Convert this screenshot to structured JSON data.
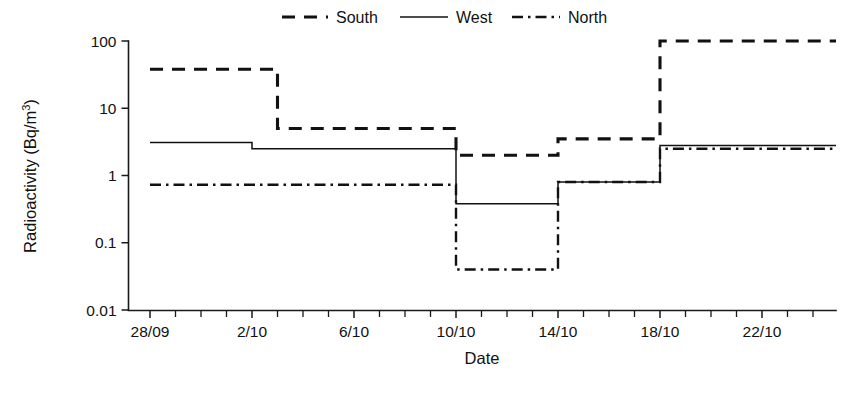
{
  "chart_data": {
    "type": "line",
    "subtype": "step-post",
    "title": "",
    "xlabel": "Date",
    "ylabel": "Radioactivity (Bq/m3)",
    "ylabel_display": "Radioactivity (Bq/m",
    "ylabel_exponent": "3",
    "ylabel_suffix": ")",
    "yscale": "log",
    "ylim": [
      0.01,
      100
    ],
    "ytick_labels": [
      "100",
      "10",
      "1",
      "0.1",
      "0.01"
    ],
    "ytick_values": [
      100,
      10,
      1,
      0.1,
      0.01
    ],
    "xtick_labels": [
      "28/09",
      "2/10",
      "6/10",
      "10/10",
      "14/10",
      "18/10",
      "22/10"
    ],
    "xtick_days": [
      0,
      4,
      8,
      12,
      16,
      20,
      24
    ],
    "x_minor_tick_interval_days": 1,
    "x_range_days": [
      0,
      27
    ],
    "grid": false,
    "legend_position": "top-center",
    "line_color": "#111111",
    "series": [
      {
        "name": "South",
        "style": "dashed",
        "steps": [
          {
            "x_start_day": 0,
            "x_end_day": 5,
            "value": 38
          },
          {
            "x_start_day": 5,
            "x_end_day": 12,
            "value": 5
          },
          {
            "x_start_day": 12,
            "x_end_day": 16,
            "value": 2
          },
          {
            "x_start_day": 16,
            "x_end_day": 20,
            "value": 3.5
          },
          {
            "x_start_day": 20,
            "x_end_day": 27,
            "value": 100
          }
        ]
      },
      {
        "name": "West",
        "style": "solid",
        "steps": [
          {
            "x_start_day": 0,
            "x_end_day": 4,
            "value": 3.1
          },
          {
            "x_start_day": 4,
            "x_end_day": 12,
            "value": 2.5
          },
          {
            "x_start_day": 12,
            "x_end_day": 16,
            "value": 0.38
          },
          {
            "x_start_day": 16,
            "x_end_day": 20,
            "value": 0.8
          },
          {
            "x_start_day": 20,
            "x_end_day": 27,
            "value": 2.8
          }
        ]
      },
      {
        "name": "North",
        "style": "dash-dot",
        "steps": [
          {
            "x_start_day": 0,
            "x_end_day": 12,
            "value": 0.73
          },
          {
            "x_start_day": 12,
            "x_end_day": 16,
            "value": 0.04
          },
          {
            "x_start_day": 16,
            "x_end_day": 20,
            "value": 0.8
          },
          {
            "x_start_day": 20,
            "x_end_day": 27,
            "value": 2.5
          }
        ]
      }
    ]
  },
  "legend": {
    "entries": [
      {
        "label": "South",
        "style": "dashed"
      },
      {
        "label": "West",
        "style": "solid"
      },
      {
        "label": "North",
        "style": "dash-dot"
      }
    ]
  },
  "axes": {
    "x_title": "Date",
    "y_title_base": "Radioactivity (Bq/m",
    "y_title_exp": "3",
    "y_title_close": ")"
  }
}
